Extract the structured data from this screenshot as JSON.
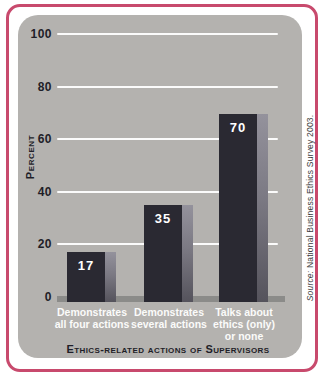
{
  "chart_data": {
    "type": "bar",
    "categories": [
      "Demonstrates all four actions",
      "Demonstrates several actions",
      "Talks about ethics (only) or none"
    ],
    "values": [
      17,
      35,
      70
    ],
    "category_lines": [
      [
        "Demonstrates",
        "all four actions",
        ""
      ],
      [
        "Demonstrates",
        "several actions",
        ""
      ],
      [
        "Talks about",
        "ethics (only)",
        "or none"
      ]
    ],
    "title": "",
    "xlabel": "Ethics-related actions of Supervisors",
    "ylabel": "Percent",
    "ylim": [
      0,
      100
    ],
    "ytick_values": [
      0,
      20,
      40,
      60,
      80,
      100
    ],
    "ytick_labels": [
      "100",
      "80",
      "60",
      "40",
      "20",
      "0"
    ],
    "grid": true,
    "legend": false,
    "source_prefix": "Source:",
    "source_rest": " National Business Ethics Survey 2003."
  },
  "colors": {
    "frame": "#c84a6d",
    "panel_background": "#b4b2af",
    "bar_face": "#2a2932",
    "bar_side_shade": "#7b7983",
    "gridline": "#ffffff",
    "baseline": "#8b8b89",
    "axis_text": "#1f1e28",
    "bar_text": "#ffffff",
    "source_text": "#3c3c3c"
  },
  "layout": {
    "px_per_unit": 2.62,
    "bar_base_extra_px": 5
  }
}
